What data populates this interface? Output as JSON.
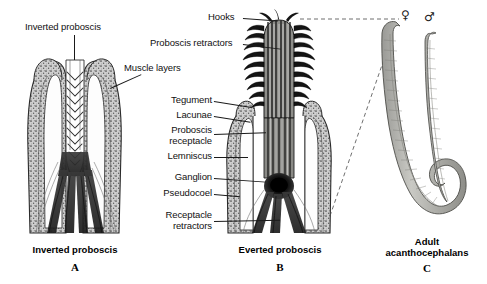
{
  "figure": {
    "background": "#ffffff",
    "ink": "#1a1a1a"
  },
  "panelA": {
    "id": "A",
    "caption": "Inverted proboscis",
    "labels": [
      {
        "text": "Inverted proboscis",
        "name": "label-inverted-proboscis"
      },
      {
        "text": "Muscle layers",
        "name": "label-muscle-layers"
      }
    ]
  },
  "panelB": {
    "id": "B",
    "caption": "Everted proboscis",
    "labels": [
      {
        "text": "Hooks",
        "name": "label-hooks"
      },
      {
        "text": "Proboscis retractors",
        "name": "label-proboscis-retractors"
      },
      {
        "text": "Tegument",
        "name": "label-tegument"
      },
      {
        "text": "Lacunae",
        "name": "label-lacunae"
      },
      {
        "text": "Proboscis\nreceptacle",
        "name": "label-proboscis-receptacle"
      },
      {
        "text": "Lemniscus",
        "name": "label-lemniscus"
      },
      {
        "text": "Ganglion",
        "name": "label-ganglion"
      },
      {
        "text": "Pseudocoel",
        "name": "label-pseudocoel"
      },
      {
        "text": "Receptacle\nretractors",
        "name": "label-receptacle-retractors"
      }
    ]
  },
  "panelC": {
    "id": "C",
    "caption": "Adult\nacanthocephalans",
    "female_symbol": "♀",
    "male_symbol": "♂"
  }
}
